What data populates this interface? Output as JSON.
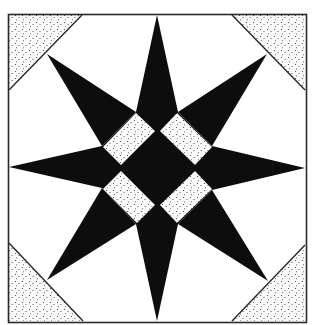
{
  "image": {
    "description": "Quilt block pattern: eight-pointed star with a central diamond of four stippled rectangles and stippled corner triangles",
    "width": 314,
    "height": 325
  },
  "colors": {
    "background": "#ffffff",
    "ink": "#0d0d0d",
    "frame": "#2a2a2a",
    "stipple_dot": "#3a3a3a",
    "stipple_fill": "#fbfbfb"
  },
  "frame": {
    "x": 8,
    "y": 14,
    "width": 298,
    "height": 308
  },
  "corner_triangles": [
    {
      "name": "top-left",
      "points": [
        [
          9,
          15
        ],
        [
          82,
          15
        ],
        [
          9,
          90
        ]
      ]
    },
    {
      "name": "top-right",
      "points": [
        [
          232,
          15
        ],
        [
          305,
          15
        ],
        [
          305,
          90
        ]
      ]
    },
    {
      "name": "bottom-left",
      "points": [
        [
          9,
          243
        ],
        [
          9,
          321
        ],
        [
          83,
          321
        ]
      ]
    },
    {
      "name": "bottom-right",
      "points": [
        [
          305,
          245
        ],
        [
          305,
          321
        ],
        [
          232,
          321
        ]
      ]
    }
  ],
  "corner_diagonals": [
    {
      "name": "top-left",
      "from": [
        9,
        90
      ],
      "to": [
        82,
        15
      ]
    },
    {
      "name": "top-right",
      "from": [
        232,
        15
      ],
      "to": [
        305,
        90
      ]
    },
    {
      "name": "bottom-left",
      "from": [
        9,
        243
      ],
      "to": [
        83,
        321
      ]
    },
    {
      "name": "bottom-right",
      "from": [
        232,
        321
      ],
      "to": [
        305,
        245
      ]
    }
  ],
  "star": {
    "center": [
      157,
      168
    ],
    "points": [
      {
        "name": "top",
        "tip": [
          157,
          15
        ],
        "base": [
          [
            136,
            112
          ],
          [
            178,
            112
          ]
        ]
      },
      {
        "name": "bottom",
        "tip": [
          157,
          321
        ],
        "base": [
          [
            136,
            224
          ],
          [
            178,
            224
          ]
        ]
      },
      {
        "name": "left",
        "tip": [
          9,
          167
        ],
        "base": [
          [
            102,
            146
          ],
          [
            102,
            188
          ]
        ]
      },
      {
        "name": "right",
        "tip": [
          305,
          168
        ],
        "base": [
          [
            212,
            146
          ],
          [
            212,
            190
          ]
        ]
      },
      {
        "name": "top-left",
        "tip": [
          47,
          54
        ],
        "base": [
          [
            136,
            112
          ],
          [
            102,
            146
          ]
        ]
      },
      {
        "name": "top-right",
        "tip": [
          267,
          54
        ],
        "base": [
          [
            178,
            112
          ],
          [
            212,
            146
          ]
        ]
      },
      {
        "name": "bottom-left",
        "tip": [
          47,
          280
        ],
        "base": [
          [
            102,
            188
          ],
          [
            136,
            224
          ]
        ]
      },
      {
        "name": "bottom-right",
        "tip": [
          268,
          281
        ],
        "base": [
          [
            212,
            190
          ],
          [
            178,
            224
          ]
        ]
      }
    ],
    "core": [
      [
        136,
        112
      ],
      [
        178,
        112
      ],
      [
        212,
        146
      ],
      [
        212,
        190
      ],
      [
        178,
        224
      ],
      [
        136,
        224
      ],
      [
        102,
        188
      ],
      [
        102,
        146
      ]
    ]
  },
  "center_rectangles": [
    {
      "name": "top-left",
      "points": [
        [
          136,
          113
        ],
        [
          155,
          131
        ],
        [
          121,
          165
        ],
        [
          103,
          147
        ]
      ]
    },
    {
      "name": "top-right",
      "points": [
        [
          160,
          131
        ],
        [
          177,
          113
        ],
        [
          212,
          147
        ],
        [
          195,
          165
        ]
      ]
    },
    {
      "name": "bottom-left",
      "points": [
        [
          103,
          189
        ],
        [
          121,
          171
        ],
        [
          155,
          205
        ],
        [
          137,
          223
        ]
      ]
    },
    {
      "name": "bottom-right",
      "points": [
        [
          160,
          205
        ],
        [
          195,
          171
        ],
        [
          212,
          189
        ],
        [
          177,
          223
        ]
      ]
    }
  ],
  "labels": {
    "figure_title": "Eight-pointed star quilt block"
  }
}
